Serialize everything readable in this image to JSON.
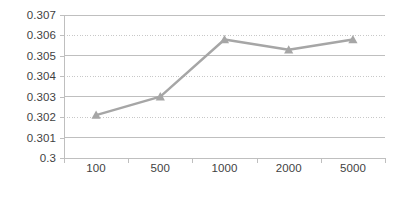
{
  "chart_data": {
    "type": "line",
    "title": "",
    "subtitle": "",
    "xlabel": "",
    "ylabel": "",
    "categories": [
      "100",
      "500",
      "1000",
      "2000",
      "5000"
    ],
    "values": [
      0.3021,
      0.303,
      0.3058,
      0.3053,
      0.3058
    ],
    "series": [
      {
        "name": "",
        "values": [
          0.3021,
          0.303,
          0.3058,
          0.3053,
          0.3058
        ],
        "color": "#a6a6a6",
        "marker": "triangle"
      }
    ],
    "ylim": [
      0.3,
      0.307
    ],
    "ytick_labels": [
      "0.307",
      "0.306",
      "0.305",
      "0.304",
      "0.303",
      "0.302",
      "0.301",
      "0.3"
    ],
    "ytick_values": [
      0.307,
      0.306,
      0.305,
      0.304,
      0.303,
      0.302,
      0.301,
      0.3
    ],
    "xtick_labels": [
      "100",
      "500",
      "1000",
      "2000",
      "5000"
    ],
    "grid": true,
    "grid_style": "alternating-solid-dotted",
    "legend": false,
    "legend_position": "none",
    "colors": {
      "series": "#a6a6a6",
      "gridline_solid": "#bfbfbf",
      "gridline_dotted": "#c8c8c8",
      "axis": "#bfbfbf",
      "tick_text": "#3f3f3f",
      "background": "#ffffff"
    }
  }
}
